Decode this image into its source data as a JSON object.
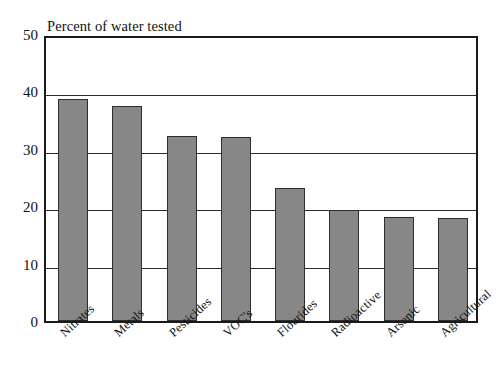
{
  "chart_data": {
    "type": "bar",
    "title": "Percent of water tested",
    "xlabel": "",
    "ylabel": "",
    "ylim": [
      0,
      50
    ],
    "yticks": [
      "0",
      "10",
      "20",
      "30",
      "40",
      "50"
    ],
    "grid": true,
    "legend": "none",
    "bar_color": "#878787",
    "bar_outline_color": "#2e2e2e",
    "axis_color": "#1a1a1a",
    "categories": [
      "Nitrates",
      "Metals",
      "Pesticides",
      "VOC's",
      "Flourides",
      "Radioactive",
      "Arsenic",
      "Agricultural"
    ],
    "values": [
      38.7,
      37.5,
      32.2,
      32.1,
      23.2,
      19.3,
      18.2,
      17.9
    ]
  }
}
